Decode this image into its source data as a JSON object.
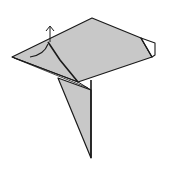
{
  "diagram": {
    "type": "origami-fold-diagram",
    "colors": {
      "paper": "#c8c8c8",
      "outline": "#1a1a1a",
      "background": "#ffffff",
      "flap": "#ffffff"
    },
    "elements": [
      "main-sheet",
      "hanging-triangle-flap",
      "right-corner-flap",
      "fold-arrow-up",
      "curved-fold-line",
      "diagonal-crease"
    ]
  }
}
